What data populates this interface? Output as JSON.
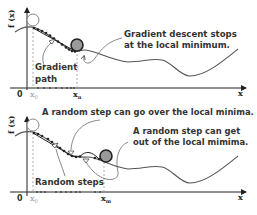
{
  "colors": {
    "curve": "#555555",
    "path": "#222222",
    "ball_fill": "#999999",
    "ball_stroke": "#222222",
    "start_circle_stroke": "#888888",
    "text": "#333333",
    "dashed": "#999999"
  },
  "top_panel": {
    "y_axis_label": "f (x)",
    "origin_label": "0",
    "x0_label": "x",
    "x0_sub": "0",
    "xn_label": "x",
    "xn_sub": "n",
    "x_axis_label": "x",
    "annotation_line1": "Gradient descent stops",
    "annotation_line2": "at the local minimum.",
    "path_label_line1": "Gradient",
    "path_label_line2": "path"
  },
  "bottom_panel": {
    "y_axis_label": "f (x)",
    "origin_label": "0",
    "x0_label": "x",
    "x0_sub": "0",
    "xm_label": "x",
    "xm_sub": "m",
    "x_axis_label": "x",
    "annotation_over": "A random step can go over the local minima.",
    "annotation_out_line1": "A random step can get",
    "annotation_out_line2": "out of the local mimima.",
    "steps_label": "Random steps"
  }
}
